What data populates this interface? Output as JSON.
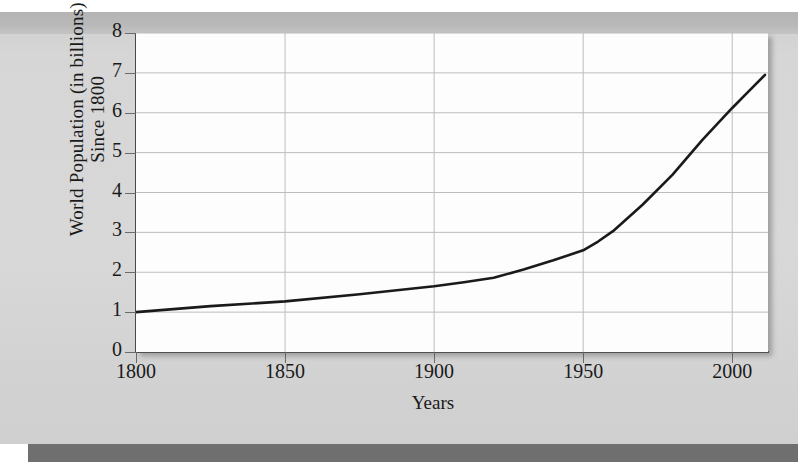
{
  "figure": {
    "background_color": "#d8d8d8",
    "plot_background_color": "#fdfdfd",
    "line_color": "#1a1a1a",
    "grid_color": "#bdbdbd",
    "axis_color": "#4a4a4a"
  },
  "chart_data": {
    "type": "line",
    "title": "",
    "xlabel": "Years",
    "ylabel": "World Population (in billions) Since 1800",
    "ylabel_line1": "World Population (in billions)",
    "ylabel_line2": "Since 1800",
    "xlim": [
      1800,
      2012
    ],
    "ylim": [
      0,
      8
    ],
    "xticks": [
      1800,
      1850,
      1900,
      1950,
      2000
    ],
    "xtick_labels": [
      "1800",
      "1850",
      "1900",
      "1950",
      "2000"
    ],
    "yticks": [
      0,
      1,
      2,
      3,
      4,
      5,
      6,
      7,
      8
    ],
    "ytick_labels": [
      "0",
      "1",
      "2",
      "3",
      "4",
      "5",
      "6",
      "7",
      "8"
    ],
    "grid": true,
    "legend": null,
    "series": [
      {
        "name": "World population",
        "x": [
          1800,
          1825,
          1850,
          1875,
          1900,
          1910,
          1920,
          1930,
          1940,
          1950,
          1955,
          1960,
          1970,
          1980,
          1990,
          2000,
          2005,
          2011
        ],
        "y": [
          1.0,
          1.15,
          1.27,
          1.45,
          1.65,
          1.75,
          1.86,
          2.07,
          2.3,
          2.55,
          2.77,
          3.03,
          3.7,
          4.45,
          5.32,
          6.12,
          6.5,
          6.95
        ]
      }
    ]
  }
}
